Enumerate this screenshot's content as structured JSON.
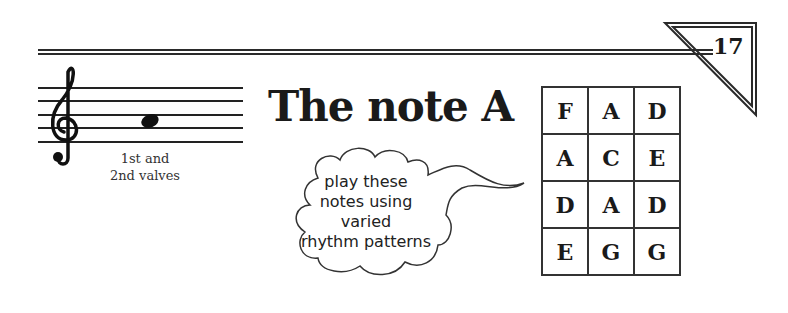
{
  "page": {
    "number": "17",
    "title": "The note A",
    "note": {
      "name": "A",
      "clef": "treble",
      "caption_line1": "1st and",
      "caption_line2": "2nd valves"
    },
    "bubble": {
      "line1": "play these",
      "line2": "notes using",
      "line3": "varied",
      "line4": "rhythm patterns"
    },
    "note_grid": [
      [
        "F",
        "A",
        "D"
      ],
      [
        "A",
        "C",
        "E"
      ],
      [
        "D",
        "A",
        "D"
      ],
      [
        "E",
        "G",
        "G"
      ]
    ]
  }
}
